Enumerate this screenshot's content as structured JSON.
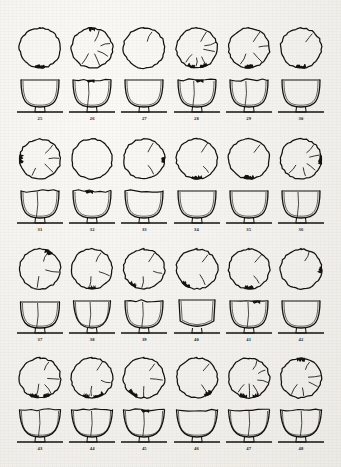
{
  "plate": {
    "kind": "archaeological-pottery-plate",
    "description": "Scanned illustration plate of ceramic bowls: top view above, profile section below",
    "background_color": "#f2f0ec",
    "ink_color": "#14120f",
    "total_items": 24,
    "number_range": "25-48"
  },
  "blocks": [
    {
      "index": 1,
      "top": 22,
      "items": [
        {
          "number": "25",
          "top_cracks": 0,
          "chip": "bottom-small",
          "profile": "round-deep",
          "rim": "plain"
        },
        {
          "number": "26",
          "top_cracks": 5,
          "chip": "top-notch",
          "profile": "round-deep",
          "rim": "notched"
        },
        {
          "number": "27",
          "top_cracks": 1,
          "chip": "none",
          "profile": "round-deep",
          "rim": "plain"
        },
        {
          "number": "28",
          "top_cracks": 6,
          "chip": "bottom-large",
          "profile": "round-deep",
          "rim": "broken"
        },
        {
          "number": "29",
          "top_cracks": 4,
          "chip": "bottom-small",
          "profile": "round-deep",
          "rim": "cracked"
        },
        {
          "number": "30",
          "top_cracks": 1,
          "chip": "bottom-small",
          "profile": "round-deep",
          "rim": "plain"
        }
      ]
    },
    {
      "index": 2,
      "top": 133,
      "items": [
        {
          "number": "31",
          "top_cracks": 4,
          "chip": "left-edge",
          "profile": "round-deep",
          "rim": "cracked"
        },
        {
          "number": "32",
          "top_cracks": 0,
          "chip": "none",
          "profile": "round-deep",
          "rim": "notched"
        },
        {
          "number": "33",
          "top_cracks": 2,
          "chip": "right-edge",
          "profile": "round-deep",
          "rim": "wavy"
        },
        {
          "number": "34",
          "top_cracks": 2,
          "chip": "bottom-small",
          "profile": "round-deep",
          "rim": "plain"
        },
        {
          "number": "35",
          "top_cracks": 1,
          "chip": "bottom-small",
          "profile": "round-deep",
          "rim": "plain"
        },
        {
          "number": "36",
          "top_cracks": 5,
          "chip": "right-edge",
          "profile": "round-deep",
          "rim": "plain"
        }
      ]
    },
    {
      "index": 3,
      "top": 243,
      "items": [
        {
          "number": "37",
          "top_cracks": 3,
          "chip": "top-right",
          "profile": "round-shallow",
          "rim": "plain"
        },
        {
          "number": "38",
          "top_cracks": 3,
          "chip": "bottom-small",
          "profile": "flared",
          "rim": "plain"
        },
        {
          "number": "39",
          "top_cracks": 3,
          "chip": "bottom-left",
          "profile": "round-deep",
          "rim": "cracked"
        },
        {
          "number": "40",
          "top_cracks": 2,
          "chip": "bottom-left",
          "profile": "u-deep",
          "rim": "open"
        },
        {
          "number": "41",
          "top_cracks": 2,
          "chip": "bottom-small",
          "profile": "round-deep",
          "rim": "broken"
        },
        {
          "number": "42",
          "top_cracks": 1,
          "chip": "right-edge",
          "profile": "round-deep",
          "rim": "plain"
        }
      ]
    },
    {
      "index": 4,
      "top": 352,
      "items": [
        {
          "number": "43",
          "top_cracks": 4,
          "chip": "bottom-large",
          "profile": "wide-flared",
          "rim": "wavy"
        },
        {
          "number": "44",
          "top_cracks": 3,
          "chip": "bottom-large",
          "profile": "wide-flared",
          "rim": "wavy"
        },
        {
          "number": "45",
          "top_cracks": 3,
          "chip": "bottom-left",
          "profile": "wide-flared",
          "rim": "broken"
        },
        {
          "number": "46",
          "top_cracks": 2,
          "chip": "bottom-right",
          "profile": "wide-flared",
          "rim": "wavy"
        },
        {
          "number": "47",
          "top_cracks": 6,
          "chip": "bottom-large",
          "profile": "wide-flared",
          "rim": "wavy"
        },
        {
          "number": "48",
          "top_cracks": 5,
          "chip": "top-notch",
          "profile": "wide-flared",
          "rim": "wavy"
        }
      ]
    }
  ]
}
